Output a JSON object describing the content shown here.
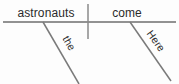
{
  "diagram": {
    "type": "sentence-diagram",
    "canvas": {
      "width": 179,
      "height": 84,
      "background": "#fdfdfd"
    },
    "line_color": "#6e6e6e",
    "text_color": "#2b2b2b",
    "baseline": {
      "name": "main-horizontal-baseline",
      "x1": 3,
      "y1": 22,
      "x2": 176,
      "y2": 22
    },
    "divider": {
      "name": "subject-predicate-divider",
      "x1": 88,
      "y1": 4,
      "x2": 88,
      "y2": 39
    },
    "slants": [
      {
        "name": "modifier-slant-the",
        "x1": 43,
        "y1": 22,
        "x2": 79,
        "y2": 84
      },
      {
        "name": "modifier-slant-here",
        "x1": 130,
        "y1": 22,
        "x2": 171,
        "y2": 81
      }
    ],
    "words": {
      "subject": {
        "text": "astronauts",
        "x": 46,
        "y": 17,
        "anchor": "middle",
        "role": "subject"
      },
      "verb": {
        "text": "come",
        "x": 127,
        "y": 17,
        "anchor": "middle",
        "role": "verb"
      },
      "subject_modifier": {
        "text": "the",
        "x": 66,
        "y": 45,
        "rotation": 60,
        "role": "article-modifier"
      },
      "verb_modifier": {
        "text": "Here",
        "x": 153,
        "y": 43,
        "rotation": 55,
        "role": "adverb-modifier"
      }
    },
    "sentence": "Here come the astronauts"
  }
}
